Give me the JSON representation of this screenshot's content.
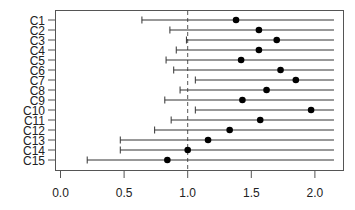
{
  "chart_data": {
    "type": "forest",
    "title": "",
    "xlabel": "",
    "ylabel": "",
    "xlim": [
      -0.05,
      2.22
    ],
    "xticks": [
      "0.0",
      "0.5",
      "1.0",
      "1.5",
      "2.0"
    ],
    "xtick_values": [
      0.0,
      0.5,
      1.0,
      1.5,
      2.0
    ],
    "reference_line": {
      "x": 1.0,
      "style": "dashed"
    },
    "grid": false,
    "legend": null,
    "categories": [
      "C1",
      "C2",
      "C3",
      "C4",
      "C5",
      "C6",
      "C7",
      "C8",
      "C9",
      "C10",
      "C11",
      "C12",
      "C13",
      "C14",
      "C15"
    ],
    "series": [
      {
        "name": "estimate",
        "values": [
          1.38,
          1.56,
          1.7,
          1.56,
          1.42,
          1.73,
          1.85,
          1.62,
          1.43,
          1.97,
          1.57,
          1.33,
          1.16,
          1.0,
          0.84
        ]
      },
      {
        "name": "lower",
        "values": [
          0.64,
          0.86,
          0.99,
          0.91,
          0.83,
          0.89,
          1.06,
          0.94,
          0.82,
          1.06,
          0.87,
          0.74,
          0.47,
          0.47,
          0.21
        ]
      },
      {
        "name": "upper",
        "values": [
          2.15,
          2.15,
          2.15,
          2.15,
          2.15,
          2.15,
          2.15,
          2.15,
          2.15,
          2.15,
          2.15,
          2.15,
          2.15,
          2.15,
          2.15
        ]
      }
    ]
  }
}
